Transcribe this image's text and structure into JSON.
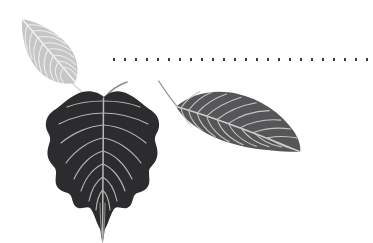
{
  "scene": {
    "title": "Decorative leaf illustration with dotted rule",
    "background_color": "#ffffff",
    "width": 373,
    "height": 243
  },
  "decorations": {
    "dotted_rule": {
      "name": "dotted-rule",
      "dot_count": 24,
      "dot_color": "#3a3a42",
      "dot_width": 2,
      "dot_height": 3,
      "dot_gap": 9,
      "start_x": 113,
      "y": 58
    }
  },
  "leaves": [
    {
      "id": "leaf-light-top-left",
      "label": "Light gray lanceolate leaf",
      "fill": "#c6c6c6",
      "vein_color": "#f2f2f2",
      "stem_color": "#d5d5d5",
      "shape": "lanceolate",
      "rotation_deg": -38,
      "position": {
        "x": 12,
        "y": 14
      },
      "size": {
        "width": 72,
        "height": 78
      }
    },
    {
      "id": "leaf-dark-center",
      "label": "Dark heart-shaped bodhi leaf",
      "fill": "#2c2c2e",
      "vein_color": "#b9b9b9",
      "stem_color": "#8d8d8d",
      "shape": "cordate-drip-tip",
      "rotation_deg": 0,
      "position": {
        "x": 44,
        "y": 90
      },
      "size": {
        "width": 120,
        "height": 143
      }
    },
    {
      "id": "leaf-mid-right",
      "label": "Medium gray elliptic leaf",
      "fill": "#565658",
      "vein_color": "#cfcfcf",
      "stem_color": "#9a9a9a",
      "shape": "elliptic",
      "rotation_deg": 20,
      "position": {
        "x": 150,
        "y": 92
      },
      "size": {
        "width": 150,
        "height": 74
      }
    }
  ]
}
